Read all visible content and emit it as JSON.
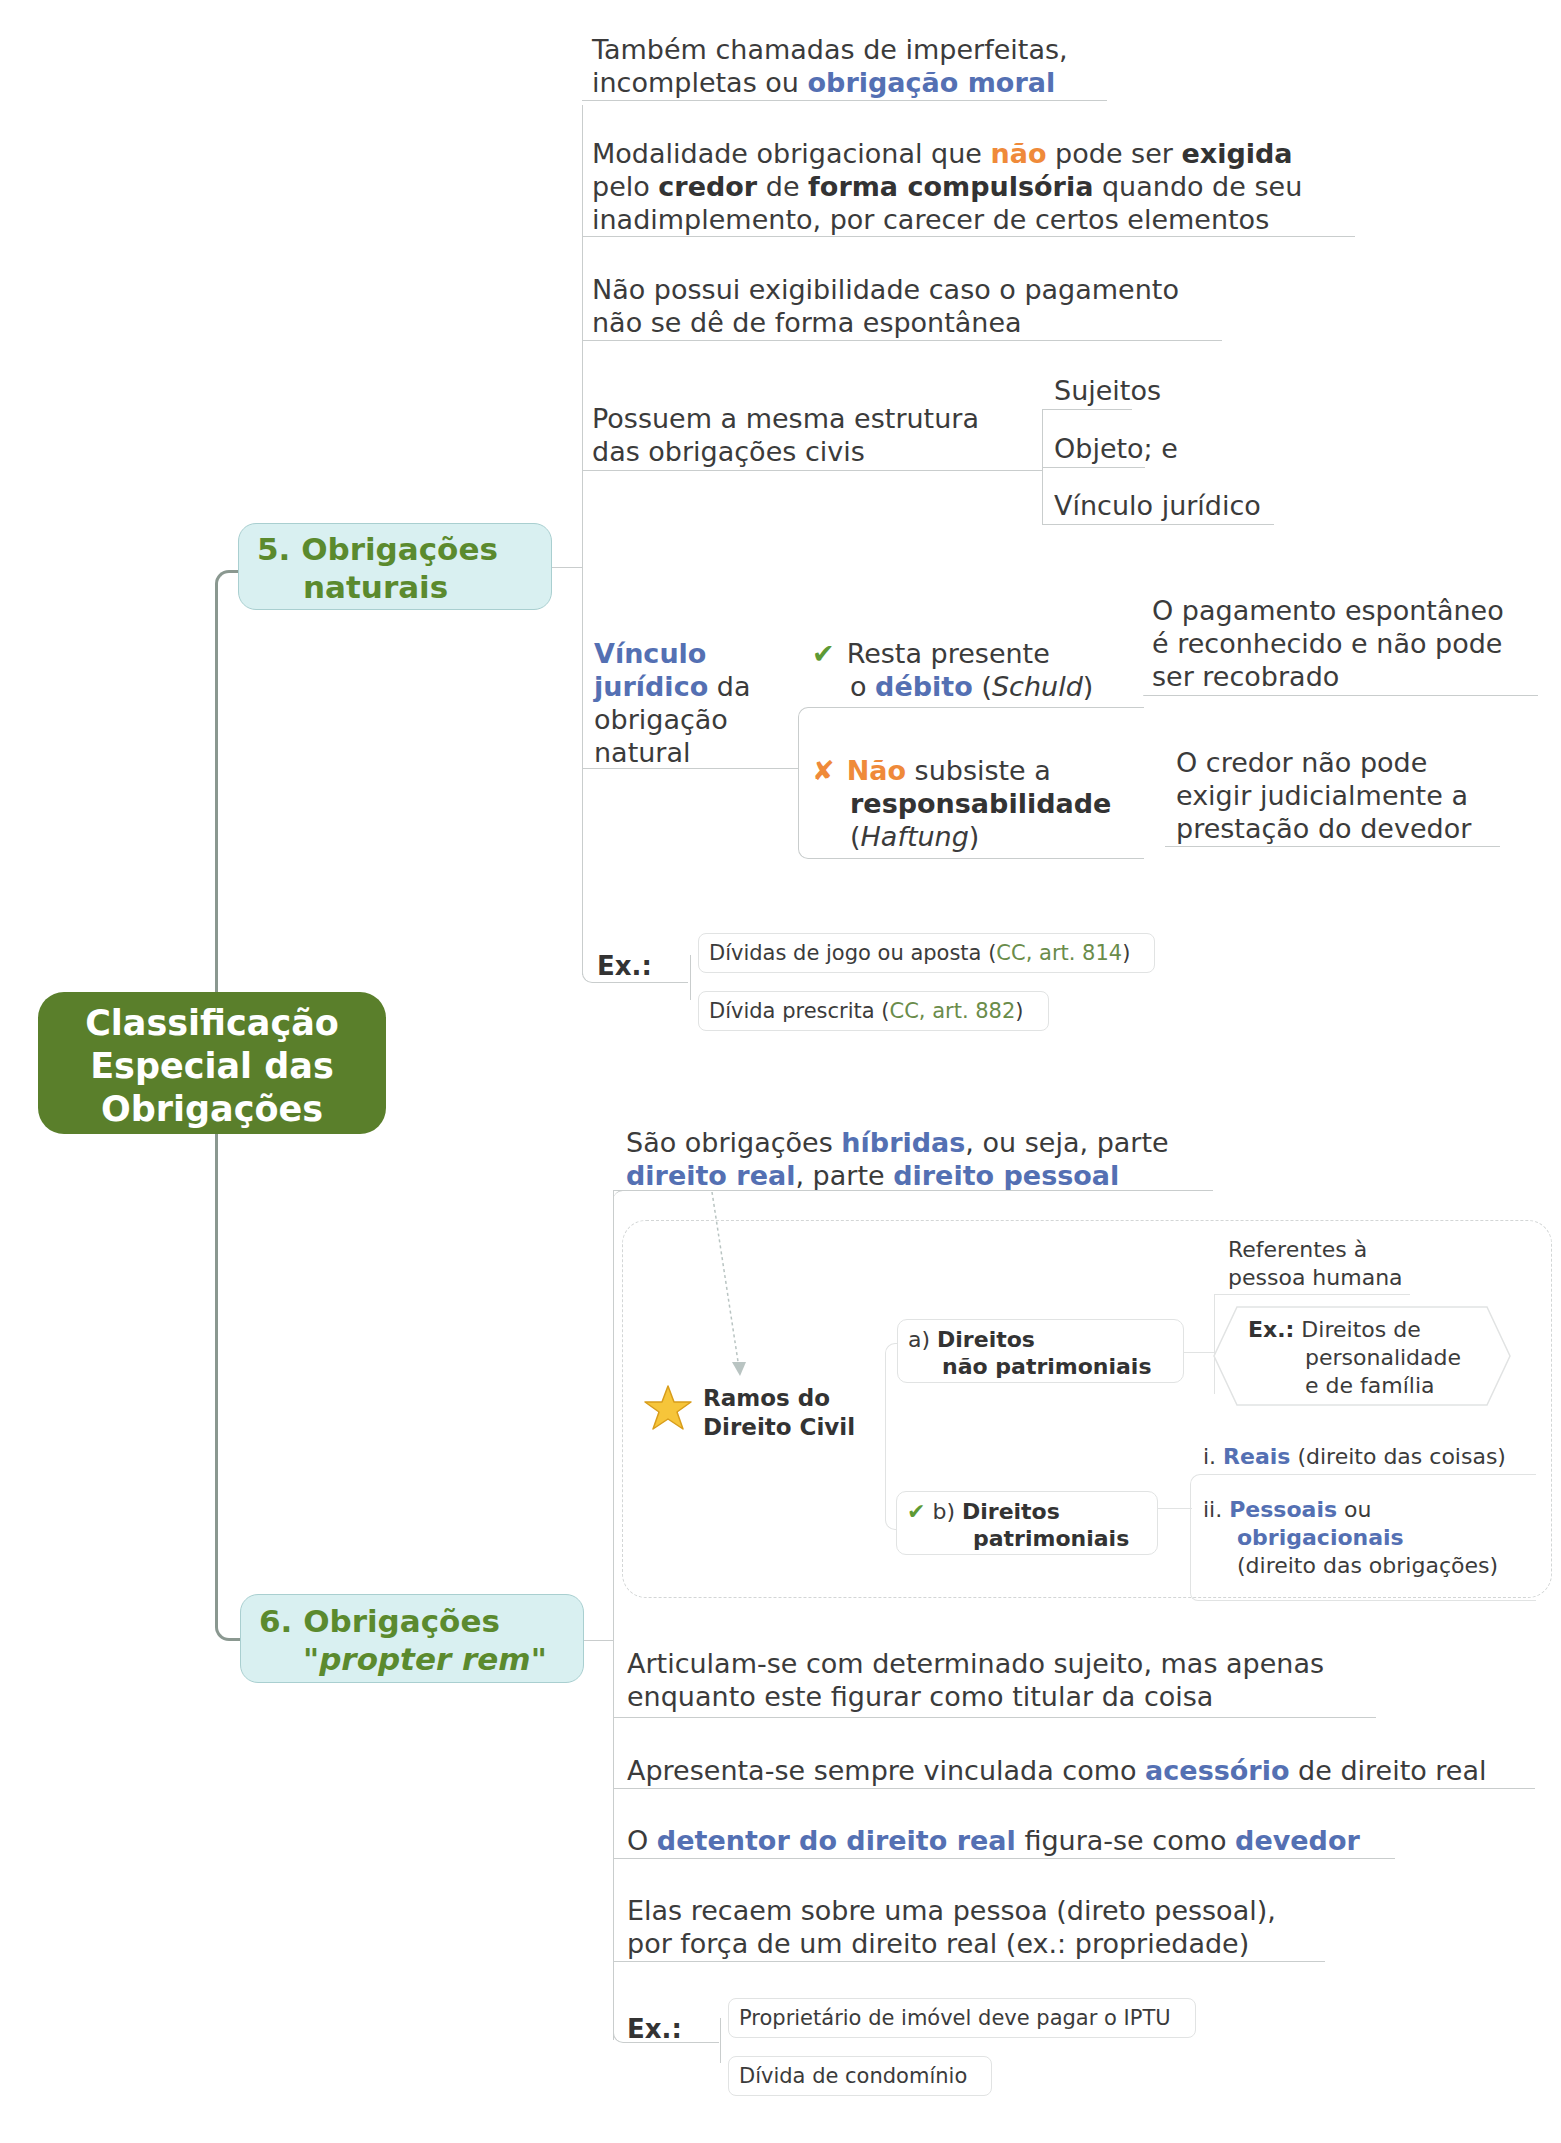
{
  "root": {
    "line1": "Classificação",
    "line2": "Especial das",
    "line3": "Obrigações",
    "color": "#5a7f2b"
  },
  "section5": {
    "title_line1": "5. Obrigações",
    "title_line2": "naturais",
    "items": [
      {
        "l1": "Também chamadas de imperfeitas,",
        "l2a": "incompletas ou ",
        "l2b": "obrigação moral"
      },
      {
        "l1a": "Modalidade obrigacional que ",
        "l1b": "não",
        "l1c": " pode ser ",
        "l1d": "exigida",
        "l2a": "pelo ",
        "l2b": "credor",
        "l2c": " de ",
        "l2d": "forma compulsória",
        "l2e": " quando de seu",
        "l3": "inadimplemento, por carecer de certos elementos"
      },
      {
        "l1": "Não possui exigibilidade caso o pagamento",
        "l2": "não se dê de forma espontânea"
      },
      {
        "l1": "Possuem a mesma estrutura",
        "l2": "das obrigações civis",
        "children": [
          "Sujeitos",
          "Objeto; e",
          "Vínculo jurídico"
        ]
      }
    ],
    "vinculo": {
      "l1": "Vínculo",
      "l2a": "jurídico",
      "l2b": " da",
      "l3": "obrigação",
      "l4": "natural",
      "check": {
        "icon": "check-icon",
        "l1": "Resta  presente",
        "l2a": "o ",
        "l2b": "débito",
        "l2c": " (",
        "l2d": "Schuld",
        "l2e": ")",
        "detail": [
          "O pagamento espontâneo",
          "é reconhecido e não pode",
          "ser recobrado"
        ]
      },
      "cross": {
        "icon": "cross-icon",
        "l1a": "Não",
        "l1b": " subsiste  a",
        "l2": "responsabilidade",
        "l3a": "(",
        "l3b": "Haftung",
        "l3c": ")",
        "detail": [
          "O credor não pode",
          "exigir judicialmente a",
          "prestação do devedor"
        ]
      }
    },
    "examples": {
      "label": "Ex.:",
      "items": [
        {
          "text": "Dívidas de jogo ou aposta (",
          "ref": "CC, art. 814",
          "close": ")"
        },
        {
          "text": "Dívida prescrita (",
          "ref": "CC, art. 882",
          "close": ")"
        }
      ]
    }
  },
  "section6": {
    "title_line1": "6. Obrigações",
    "title_line2a": "\"",
    "title_line2b": "propter rem",
    "title_line2c": "\"",
    "intro": {
      "l1a": "São obrigações ",
      "l1b": "híbridas",
      "l1c": ", ou seja, parte",
      "l2a": "direito real",
      "l2b": ", parte ",
      "l2c": "direito pessoal"
    },
    "ramos": {
      "icon": "star-icon",
      "l1": "Ramos  do",
      "l2": "Direito Civil",
      "a": {
        "prefix": "a) ",
        "l1": "Direitos",
        "l2": "não patrimoniais",
        "child1": [
          "Referentes à",
          "pessoa humana"
        ],
        "child2": {
          "label": "Ex.:",
          "l1": " Direitos  de",
          "l2": "personalidade",
          "l3": "e de família"
        }
      },
      "b": {
        "icon": "check-icon",
        "prefix": "b) ",
        "l1": "Direitos",
        "l2": "patrimoniais",
        "i": {
          "prefix": "i. ",
          "hl": "Reais",
          "rest": " (direito das coisas)"
        },
        "ii": {
          "prefix": "ii. ",
          "hl1": "Pessoais",
          "mid": " ou",
          "hl2": "obrigacionais",
          "rest": "(direito das obrigações)"
        }
      }
    },
    "items": [
      {
        "l1": "Articulam-se com determinado sujeito, mas apenas",
        "l2": "enquanto este figurar como titular da coisa"
      },
      {
        "a": "Apresenta-se sempre vinculada como ",
        "b": "acessório",
        "c": " de direito real"
      },
      {
        "a": "O ",
        "b": "detentor do direito real",
        "c": " figura-se como ",
        "d": "devedor"
      },
      {
        "l1": "Elas recaem sobre uma pessoa (direto pessoal),",
        "l2": "por força de um direito real (ex.: propriedade)"
      }
    ],
    "examples": {
      "label": "Ex.:",
      "items": [
        "Proprietário de imóvel deve pagar o IPTU",
        "Dívida de condomínio"
      ]
    }
  }
}
